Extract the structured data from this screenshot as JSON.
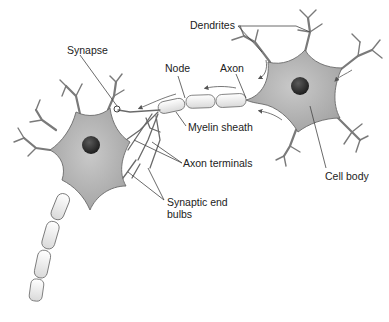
{
  "figure": {
    "colors": {
      "cell_body": "#b5b5b5",
      "nucleus": "#2e2e2e",
      "myelin": "#f2f2f2",
      "outline": "#6a6a6a",
      "label_text": "#222222"
    }
  },
  "labels": {
    "dendrites": "Dendrites",
    "synapse": "Synapse",
    "node": "Node",
    "axon": "Axon",
    "myelin_sheath": "Myelin sheath",
    "axon_terminals": "Axon terminals",
    "cell_body": "Cell body",
    "synaptic_end_bulbs_line1": "Synaptic end",
    "synaptic_end_bulbs_line2": "bulbs"
  }
}
